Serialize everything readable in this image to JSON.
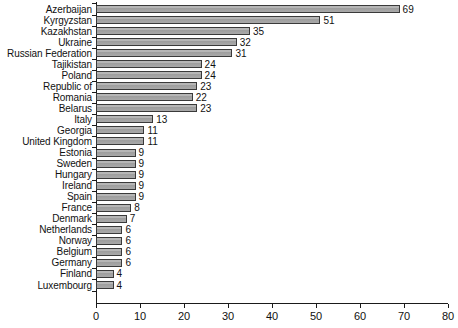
{
  "chart_data": {
    "type": "bar",
    "orientation": "horizontal",
    "title": "",
    "subtitle": "",
    "xlabel": "",
    "ylabel": "",
    "xlim": [
      0,
      80
    ],
    "xticks": [
      0,
      10,
      20,
      30,
      40,
      50,
      60,
      70,
      80
    ],
    "grid": false,
    "legend": null,
    "show_value_labels": true,
    "categories": [
      "Azerbaijan",
      "Kyrgyzstan",
      "Kazakhstan",
      "Ukraine",
      "Russian Federation",
      "Tajikistan",
      "Poland",
      "Republic of",
      "Romania",
      "Belarus",
      "Italy",
      "Georgia",
      "United Kingdom",
      "Estonia",
      "Sweden",
      "Hungary",
      "Ireland",
      "Spain",
      "France",
      "Denmark",
      "Netherlands",
      "Norway",
      "Belgium",
      "Germany",
      "Finland",
      "Luxembourg"
    ],
    "values": [
      69,
      51,
      35,
      32,
      31,
      24,
      24,
      23,
      22,
      23,
      13,
      11,
      11,
      9,
      9,
      9,
      9,
      9,
      8,
      7,
      6,
      6,
      6,
      6,
      4,
      4
    ],
    "colors": {
      "bar_fill": "#aaaaaa",
      "bar_edge": "#3a3a3a",
      "axis": "#1a1a1a",
      "text": "#111111",
      "background": "#ffffff"
    }
  }
}
